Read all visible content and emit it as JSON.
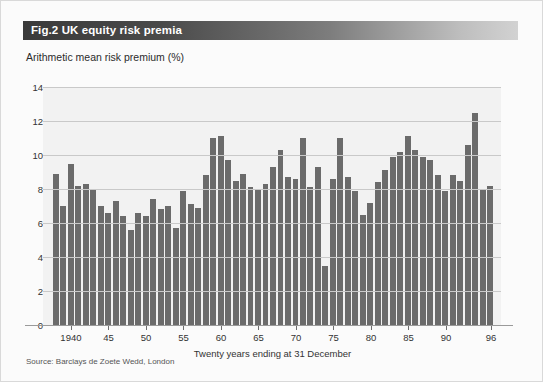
{
  "figure": {
    "title_prefix": "Fig.2",
    "title": "UK equity risk premia",
    "subtitle": "Arithmetic mean risk premium (%)",
    "source": "Source: Barclays de Zoete Wedd, London",
    "accent_bar_dark": "#3a3a3a",
    "accent_bar_light": "#d2d2d2",
    "bar_color": "#6b6b6b",
    "plot_background": "#f2f2f2",
    "gridline_color": "#c9c9c9"
  },
  "chart_data": {
    "type": "bar",
    "title": "Fig.2 UK equity risk premia",
    "subtitle": "Arithmetic mean risk premium (%)",
    "xlabel": "Twenty years ending at 31 December",
    "ylabel": "Arithmetic mean risk premium (%)",
    "ylim": [
      0,
      14
    ],
    "ytick_values": [
      0,
      2,
      4,
      6,
      8,
      10,
      12,
      14
    ],
    "ytick_labels": [
      "0",
      "2",
      "4",
      "6",
      "8",
      "10",
      "12",
      "14"
    ],
    "xtick_labels": [
      "1940",
      "45",
      "50",
      "55",
      "60",
      "65",
      "70",
      "75",
      "80",
      "85",
      "90",
      "96"
    ],
    "xtick_years": [
      1940,
      1945,
      1950,
      1955,
      1960,
      1965,
      1970,
      1975,
      1980,
      1985,
      1990,
      1996
    ],
    "grid": true,
    "legend": false,
    "categories": [
      1938,
      1939,
      1940,
      1941,
      1942,
      1943,
      1944,
      1945,
      1946,
      1947,
      1948,
      1949,
      1950,
      1951,
      1952,
      1953,
      1954,
      1955,
      1956,
      1957,
      1958,
      1959,
      1960,
      1961,
      1962,
      1963,
      1964,
      1965,
      1966,
      1967,
      1968,
      1969,
      1970,
      1971,
      1972,
      1973,
      1974,
      1975,
      1976,
      1977,
      1978,
      1979,
      1980,
      1981,
      1982,
      1983,
      1984,
      1985,
      1986,
      1987,
      1988,
      1989,
      1990,
      1991,
      1992,
      1993,
      1994,
      1995,
      1996
    ],
    "values": [
      8.9,
      7.0,
      9.5,
      8.2,
      8.3,
      8.0,
      7.0,
      6.6,
      7.3,
      6.4,
      5.6,
      6.6,
      6.4,
      7.4,
      6.8,
      7.0,
      5.7,
      7.9,
      7.1,
      6.9,
      8.8,
      11.0,
      11.1,
      9.7,
      8.5,
      8.9,
      8.1,
      8.0,
      8.3,
      9.3,
      10.3,
      8.7,
      8.6,
      11.0,
      8.1,
      9.3,
      3.5,
      8.6,
      11.0,
      8.7,
      7.9,
      6.5,
      7.2,
      8.4,
      9.1,
      9.9,
      10.2,
      11.1,
      10.3,
      9.9,
      9.7,
      8.8,
      7.9,
      8.8,
      8.5,
      10.6,
      12.5,
      8.0,
      8.2
    ]
  }
}
